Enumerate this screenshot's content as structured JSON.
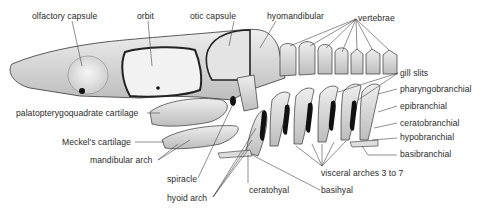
{
  "figure": {
    "labels": {
      "olfactory_capsule": "olfactory capsule",
      "orbit": "orbit",
      "otic_capsule": "otic capsule",
      "hyomandibular": "hyomandibular",
      "vertebrae": "vertebrae",
      "gill_slits": "gill slits",
      "pharyngobranchial": "pharyngobranchial",
      "epibranchial": "epibranchial",
      "ceratobranchial": "ceratobranchial",
      "hypobranchial": "hypobranchial",
      "basibranchial": "basibranchial",
      "palatopterygoquadrate_cartilage": "palatopterygoquadrate cartilage",
      "meckels_cartilage": "Meckel's cartilage",
      "mandibular_arch": "mandibular arch",
      "spiracle": "spiracle",
      "hyoid_arch": "hyoid arch",
      "ceratohyal": "ceratohyal",
      "basihyal": "basihyal",
      "visceral_arches": "visceral arches 3 to 7"
    },
    "colors": {
      "ink": "#2a2a2a",
      "fill": "#e6e6e6",
      "shade": "#9a9a9a",
      "gill_slit": "#111111"
    }
  }
}
